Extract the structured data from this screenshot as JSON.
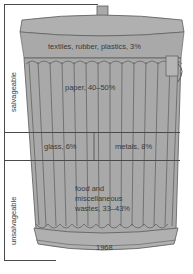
{
  "figure": {
    "type": "garbage can composition diagram",
    "year": "1968",
    "groups": [
      {
        "name": "salvageable",
        "label": "salvageable"
      },
      {
        "name": "unsalvageable",
        "label": "unsalvageable"
      }
    ],
    "segments": [
      {
        "label": "textiles, rubber, plastics, 3%",
        "group": "salvageable"
      },
      {
        "label": "paper, 40–50%",
        "group": "salvageable"
      },
      {
        "label": "glass, 6%",
        "group": "salvageable"
      },
      {
        "label": "metals, 8%",
        "group": "salvageable"
      },
      {
        "label_lines": [
          "food and",
          "miscellaneous",
          "wastes, 33–43%"
        ],
        "group": "unsalvageable"
      }
    ],
    "colors": {
      "can_fill": "#a9a9a9",
      "can_outline": "#5a5a5a",
      "text": "#3a3a3a",
      "background": "#ffffff"
    }
  }
}
